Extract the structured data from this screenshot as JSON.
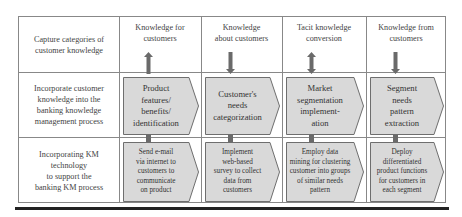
{
  "diagram": {
    "row_labels": [
      "Capture categories of customer knowledge",
      "Incorporate customer knowledge into the banking knowledge management process",
      "Incorporating KM technology to support the banking KM process"
    ],
    "row_label_lines": [
      [
        "Capture categories of",
        "customer knowledge"
      ],
      [
        "Incorporate customer",
        "knowledge into the",
        "banking knowledge",
        "management process"
      ],
      [
        "Incorporating KM",
        "technology",
        "to support the",
        "banking KM process"
      ]
    ],
    "columns": [
      {
        "header_lines": [
          "Knowledge for",
          "customers"
        ],
        "arrow_direction": "up",
        "process_lines": [
          "Product",
          "features/",
          "benefits/",
          "identification"
        ],
        "technology_lines": [
          "Send e-mail",
          "via internet to",
          "customers to",
          "communicate",
          "on product"
        ]
      },
      {
        "header_lines": [
          "Knowledge",
          "about customers"
        ],
        "arrow_direction": "down",
        "process_lines": [
          "Customer's",
          "needs",
          "categorization"
        ],
        "technology_lines": [
          "Implement",
          "web-based",
          "survey to collect",
          "data from",
          "customers"
        ]
      },
      {
        "header_lines": [
          "Tacit knowledge",
          "conversion"
        ],
        "arrow_direction": "both",
        "process_lines": [
          "Market",
          "segmentation",
          "implement-",
          "ation"
        ],
        "technology_lines": [
          "Employ data",
          "mining for clustering",
          "customer into groups",
          "of similar needs",
          "pattern"
        ]
      },
      {
        "header_lines": [
          "Knowledge from",
          "customers"
        ],
        "arrow_direction": "down",
        "process_lines": [
          "Segment",
          "needs",
          "pattern",
          "extraction"
        ],
        "technology_lines": [
          "Deploy",
          "differentiated",
          "product functions",
          "for customers in",
          "each segment"
        ]
      }
    ],
    "colors": {
      "chevron_fill": "#d9d9d9",
      "chevron_stroke": "#6e6e6e",
      "arrow_fill": "#6a6a6a",
      "grid_line": "#888888"
    }
  }
}
